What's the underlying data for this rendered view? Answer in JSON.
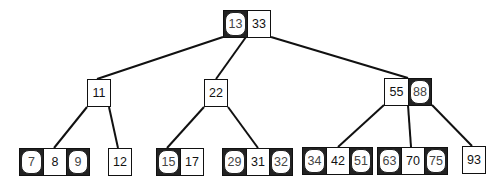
{
  "diagram": {
    "type": "red-black tree drawn as 2-3-4 tree (B-tree)",
    "legend_note": "rounded keys = red, square keys = black",
    "nodes": [
      {
        "id": "root",
        "keys": [
          {
            "v": "13",
            "c": "red"
          },
          {
            "v": "33",
            "c": "black"
          }
        ],
        "x": 223,
        "y": 10
      },
      {
        "id": "n11",
        "keys": [
          {
            "v": "11",
            "c": "black"
          }
        ],
        "x": 87,
        "y": 79
      },
      {
        "id": "n22",
        "keys": [
          {
            "v": "22",
            "c": "black"
          }
        ],
        "x": 204,
        "y": 79
      },
      {
        "id": "n55",
        "keys": [
          {
            "v": "55",
            "c": "black"
          },
          {
            "v": "88",
            "c": "red"
          }
        ],
        "x": 384,
        "y": 78
      },
      {
        "id": "l789",
        "keys": [
          {
            "v": "7",
            "c": "red"
          },
          {
            "v": "8",
            "c": "black"
          },
          {
            "v": "9",
            "c": "red"
          }
        ],
        "x": 19,
        "y": 148
      },
      {
        "id": "l12",
        "keys": [
          {
            "v": "12",
            "c": "black"
          }
        ],
        "x": 108,
        "y": 148
      },
      {
        "id": "l1517",
        "keys": [
          {
            "v": "15",
            "c": "red"
          },
          {
            "v": "17",
            "c": "black"
          }
        ],
        "x": 156,
        "y": 148
      },
      {
        "id": "l293132",
        "keys": [
          {
            "v": "29",
            "c": "red"
          },
          {
            "v": "31",
            "c": "black"
          },
          {
            "v": "32",
            "c": "red"
          }
        ],
        "x": 222,
        "y": 148
      },
      {
        "id": "l344251",
        "keys": [
          {
            "v": "34",
            "c": "red"
          },
          {
            "v": "42",
            "c": "black"
          },
          {
            "v": "51",
            "c": "red"
          }
        ],
        "x": 302,
        "y": 147
      },
      {
        "id": "l637075",
        "keys": [
          {
            "v": "63",
            "c": "red"
          },
          {
            "v": "70",
            "c": "black"
          },
          {
            "v": "75",
            "c": "red"
          }
        ],
        "x": 377,
        "y": 147
      },
      {
        "id": "l93",
        "keys": [
          {
            "v": "93",
            "c": "black"
          }
        ],
        "x": 462,
        "y": 146
      }
    ],
    "edges": [
      [
        223,
        37,
        97,
        79
      ],
      [
        246,
        37,
        216,
        79
      ],
      [
        271,
        37,
        408,
        78
      ],
      [
        87,
        107,
        54,
        148
      ],
      [
        109,
        107,
        118,
        148
      ],
      [
        204,
        107,
        167,
        148
      ],
      [
        228,
        107,
        258,
        148
      ],
      [
        384,
        105,
        338,
        147
      ],
      [
        408,
        105,
        411,
        147
      ],
      [
        432,
        105,
        472,
        146
      ]
    ]
  }
}
